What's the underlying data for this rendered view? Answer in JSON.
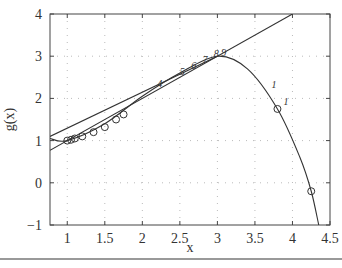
{
  "chart_data": {
    "type": "line",
    "title": "",
    "xlabel": "x",
    "ylabel": "g(x)",
    "xlim": [
      0.77,
      4.5
    ],
    "ylim": [
      -1,
      4
    ],
    "xticks": [
      "1",
      "1.5",
      "2",
      "2.5",
      "3",
      "3.5",
      "4",
      "4.5"
    ],
    "yticks": [
      "-1",
      "0",
      "1",
      "2",
      "3",
      "4"
    ],
    "grid": true,
    "series": [
      {
        "name": "g(x)",
        "x": [
          0.77,
          1.0,
          1.5,
          2.0,
          2.5,
          3.0,
          3.4,
          3.8,
          4.1,
          4.25,
          4.35
        ],
        "y": [
          1.05,
          1.0,
          1.4,
          2.05,
          2.6,
          3.0,
          2.7,
          1.75,
          0.6,
          -0.2,
          -1.0
        ]
      },
      {
        "name": "line y=x",
        "x": [
          0.77,
          4.0
        ],
        "y": [
          0.77,
          4.0
        ]
      },
      {
        "name": "line secant",
        "x": [
          0.77,
          3.0
        ],
        "y": [
          1.1,
          3.0
        ]
      }
    ],
    "markers": {
      "circles": [
        [
          1.0,
          1.0
        ],
        [
          1.05,
          1.02
        ],
        [
          1.1,
          1.05
        ],
        [
          1.2,
          1.1
        ],
        [
          1.35,
          1.2
        ],
        [
          1.5,
          1.32
        ],
        [
          1.65,
          1.5
        ],
        [
          1.75,
          1.62
        ],
        [
          3.8,
          1.75
        ],
        [
          4.25,
          -0.2
        ]
      ],
      "labels": [
        {
          "text": "4",
          "x": 2.2,
          "y": 2.28
        },
        {
          "text": "5",
          "x": 2.5,
          "y": 2.55
        },
        {
          "text": "6",
          "x": 2.65,
          "y": 2.7
        },
        {
          "text": "7",
          "x": 2.8,
          "y": 2.85
        },
        {
          "text": "8",
          "x": 2.95,
          "y": 2.97
        },
        {
          "text": "9",
          "x": 3.05,
          "y": 3.0
        },
        {
          "text": "1",
          "x": 3.72,
          "y": 2.25
        },
        {
          "text": "1",
          "x": 3.88,
          "y": 1.85
        }
      ]
    }
  }
}
